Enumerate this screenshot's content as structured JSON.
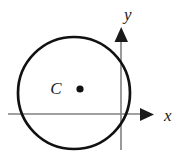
{
  "figure": {
    "type": "geometry-diagram",
    "background_color": "#ffffff"
  },
  "axes": {
    "x_axis": {
      "label": "x",
      "color": "#808080",
      "arrow_color": "#1a1a1a",
      "start_x": 8,
      "end_x": 152,
      "y": 114,
      "label_x": 166,
      "label_y": 120
    },
    "y_axis": {
      "label": "y",
      "color": "#808080",
      "arrow_color": "#1a1a1a",
      "x": 121,
      "start_y": 148,
      "end_y": 29,
      "label_x": 124,
      "label_y": 20
    }
  },
  "circle": {
    "center_x": 74,
    "center_y": 93,
    "radius": 56,
    "stroke_color": "#111111",
    "stroke_width": 2.6,
    "fill": "none"
  },
  "center_point": {
    "label": "C",
    "label_x": 56,
    "label_y": 94,
    "dot_x": 80,
    "dot_y": 89,
    "dot_radius": 3.6,
    "dot_color": "#111111"
  }
}
